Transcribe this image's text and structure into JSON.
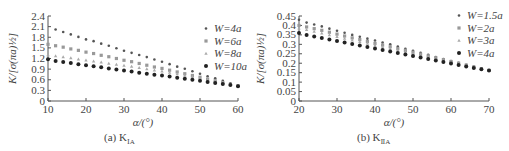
{
  "chart_data": [
    {
      "type": "scatter",
      "panel": "a",
      "caption": "(a) K",
      "caption_sub": "ⅠA",
      "title": "",
      "xlabel": "α/(°)",
      "ylabel": "K/[σ(πa)½]",
      "xlim": [
        10,
        60
      ],
      "ylim": [
        0,
        2.4
      ],
      "xticks": [
        10,
        20,
        30,
        40,
        50,
        60
      ],
      "yticks": [
        0,
        0.3,
        0.6,
        0.9,
        1.2,
        1.5,
        1.8,
        2.1,
        2.4
      ],
      "ytick_labels": [
        "0",
        "0.3",
        "0.6",
        "0.9",
        "1.2",
        "1.5",
        "1.8",
        "2.1",
        "2.4"
      ],
      "legend_position": "upper right",
      "grid": false,
      "x": [
        10,
        12,
        14,
        16,
        18,
        20,
        22,
        24,
        26,
        28,
        30,
        32,
        34,
        36,
        38,
        40,
        42,
        44,
        46,
        48,
        50,
        52,
        54,
        56,
        58,
        60
      ],
      "series": [
        {
          "name": "W=4a",
          "marker": "dot-small",
          "color": "#555555",
          "values": [
            null,
            2.02,
            1.95,
            1.88,
            1.81,
            1.74,
            1.69,
            1.62,
            1.56,
            1.49,
            1.42,
            1.36,
            1.3,
            1.24,
            1.17,
            1.11,
            1.04,
            0.97,
            0.91,
            0.84,
            0.77,
            0.7,
            0.64,
            0.57,
            0.5,
            0.44
          ]
        },
        {
          "name": "W=6a",
          "marker": "square",
          "color": "#999999",
          "values": [
            1.6,
            1.56,
            1.52,
            1.47,
            1.43,
            1.38,
            1.34,
            1.29,
            1.25,
            1.2,
            1.15,
            1.11,
            1.06,
            1.01,
            0.96,
            0.92,
            0.87,
            0.82,
            0.77,
            0.72,
            0.67,
            0.62,
            0.57,
            0.52,
            0.47,
            0.43
          ]
        },
        {
          "name": "W=8a",
          "marker": "triangle",
          "color": "#aaaaaa",
          "values": [
            1.3,
            1.27,
            1.24,
            1.21,
            1.18,
            1.15,
            1.12,
            1.09,
            1.06,
            1.03,
            1.0,
            0.97,
            0.94,
            0.9,
            0.87,
            0.84,
            0.8,
            0.76,
            0.72,
            0.68,
            0.64,
            0.6,
            0.56,
            0.52,
            0.47,
            0.43
          ]
        },
        {
          "name": "W=10a",
          "marker": "dot-large",
          "color": "#222222",
          "values": [
            1.18,
            1.13,
            1.1,
            1.07,
            1.04,
            1.01,
            0.98,
            0.95,
            0.92,
            0.89,
            0.86,
            0.83,
            0.8,
            0.77,
            0.74,
            0.72,
            0.69,
            0.66,
            0.63,
            0.6,
            0.57,
            0.54,
            0.51,
            0.48,
            0.45,
            0.42
          ]
        }
      ]
    },
    {
      "type": "scatter",
      "panel": "b",
      "caption": "(b) K",
      "caption_sub": "ⅡA",
      "title": "",
      "xlabel": "α/(°)",
      "ylabel": "K/[σ(πa)½]",
      "xlim": [
        20,
        70
      ],
      "ylim": [
        0,
        0.45
      ],
      "xticks": [
        20,
        30,
        40,
        50,
        60,
        70
      ],
      "yticks": [
        0,
        0.05,
        0.1,
        0.15,
        0.2,
        0.25,
        0.3,
        0.35,
        0.4,
        0.45
      ],
      "ytick_labels": [
        "0",
        "0.05",
        "0.1",
        "0.15",
        "0.2",
        "0.25",
        "0.3",
        "0.35",
        "0.4",
        "0.45"
      ],
      "legend_position": "upper right",
      "grid": false,
      "x": [
        20,
        22,
        24,
        26,
        28,
        30,
        32,
        34,
        36,
        38,
        40,
        42,
        44,
        46,
        48,
        50,
        52,
        54,
        56,
        58,
        60,
        62,
        64,
        66,
        68,
        70
      ],
      "series": [
        {
          "name": "W=1.5a",
          "marker": "dot-small",
          "color": "#555555",
          "values": [
            0.43,
            0.415,
            0.405,
            0.395,
            0.383,
            0.372,
            0.361,
            0.35,
            0.34,
            0.33,
            0.32,
            0.31,
            0.3,
            0.288,
            0.277,
            0.266,
            0.255,
            0.244,
            0.233,
            0.222,
            0.211,
            0.202,
            0.192,
            0.182,
            0.172,
            0.163
          ]
        },
        {
          "name": "W=2a",
          "marker": "square",
          "color": "#999999",
          "values": [
            0.4,
            0.392,
            0.383,
            0.374,
            0.364,
            0.354,
            0.344,
            0.334,
            0.325,
            0.315,
            0.305,
            0.296,
            0.287,
            0.277,
            0.268,
            0.258,
            0.248,
            0.239,
            0.229,
            0.219,
            0.209,
            0.2,
            0.19,
            0.18,
            0.171,
            0.162
          ]
        },
        {
          "name": "W=3a",
          "marker": "triangle",
          "color": "#aaaaaa",
          "values": [
            0.385,
            0.377,
            0.368,
            0.359,
            0.349,
            0.34,
            0.331,
            0.322,
            0.313,
            0.304,
            0.295,
            0.286,
            0.277,
            0.268,
            0.259,
            0.25,
            0.241,
            0.232,
            0.222,
            0.213,
            0.204,
            0.196,
            0.187,
            0.178,
            0.17,
            0.161
          ]
        },
        {
          "name": "W=4a",
          "marker": "dot-large",
          "color": "#222222",
          "values": [
            0.36,
            0.35,
            0.342,
            0.334,
            0.326,
            0.318,
            0.31,
            0.302,
            0.294,
            0.286,
            0.278,
            0.27,
            0.262,
            0.254,
            0.246,
            0.238,
            0.23,
            0.222,
            0.214,
            0.206,
            0.198,
            0.19,
            0.182,
            0.175,
            0.168,
            0.161
          ]
        }
      ]
    }
  ]
}
